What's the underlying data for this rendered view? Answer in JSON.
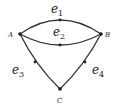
{
  "diagram": {
    "vertices": [
      {
        "id": "A",
        "label": "A"
      },
      {
        "id": "B",
        "label": "B"
      },
      {
        "id": "C",
        "label": "C"
      }
    ],
    "edges": [
      {
        "id": "e1",
        "base": "e",
        "sub": "1",
        "from": "A",
        "to": "B"
      },
      {
        "id": "e2",
        "base": "e",
        "sub": "2",
        "from": "A",
        "to": "B"
      },
      {
        "id": "e3",
        "base": "e",
        "sub": "3",
        "from": "A",
        "to": "C"
      },
      {
        "id": "e4",
        "base": "e",
        "sub": "4",
        "from": "B",
        "to": "C"
      }
    ],
    "colors": {
      "stroke": "#333333",
      "text": "#222222"
    }
  }
}
